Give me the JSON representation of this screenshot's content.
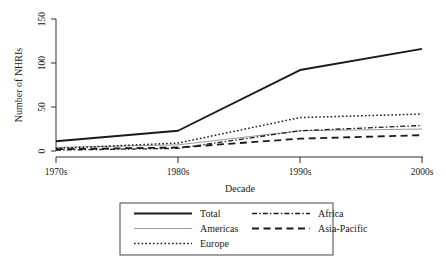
{
  "chart_data": {
    "type": "line",
    "title": "",
    "xlabel": "Decade",
    "ylabel": "Number of NHRIs",
    "categories": [
      "1970s",
      "1980s",
      "1990s",
      "2000s"
    ],
    "x_tick_labels": [
      "1970s",
      "1980s",
      "1990s",
      "2000s"
    ],
    "y_tick_labels": [
      "0",
      "50",
      "100",
      "150"
    ],
    "y_ticks": [
      0,
      50,
      100,
      150
    ],
    "ylim": [
      0,
      150
    ],
    "grid": false,
    "legend_position": "bottom",
    "series": [
      {
        "name": "Total",
        "values": [
          11,
          23,
          92,
          116
        ],
        "style": "solid",
        "color": "#1a1a1a",
        "width": 1.9
      },
      {
        "name": "Americas",
        "values": [
          4,
          7,
          23,
          25
        ],
        "style": "solid-thin",
        "color": "#9a9a9a",
        "width": 1.0
      },
      {
        "name": "Europe",
        "values": [
          3,
          9,
          38,
          42
        ],
        "style": "dotted",
        "color": "#1a1a1a",
        "width": 1.5
      },
      {
        "name": "Africa",
        "values": [
          1,
          3,
          23,
          29
        ],
        "style": "dash-dot",
        "color": "#1a1a1a",
        "width": 1.3
      },
      {
        "name": "Asia-Pacific",
        "values": [
          2,
          4,
          14,
          18
        ],
        "style": "long-dash",
        "color": "#1a1a1a",
        "width": 1.8
      }
    ],
    "legend_entries": [
      {
        "label": "Total",
        "style": "solid"
      },
      {
        "label": "Americas",
        "style": "solid-thin"
      },
      {
        "label": "Europe",
        "style": "dotted"
      },
      {
        "label": "Africa",
        "style": "dash-dot"
      },
      {
        "label": "Asia-Pacific",
        "style": "long-dash"
      }
    ]
  }
}
